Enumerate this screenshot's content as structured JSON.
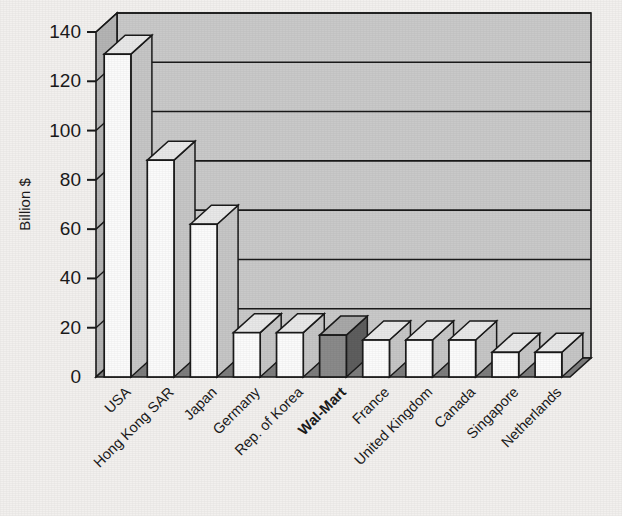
{
  "chart_data": {
    "type": "bar",
    "title": "",
    "subtitle": "",
    "xlabel": "",
    "ylabel": "Billion $",
    "ylim": [
      0,
      140
    ],
    "ytick_step": 20,
    "ytick_labels": [
      "0",
      "20",
      "40",
      "60",
      "80",
      "100",
      "120",
      "140"
    ],
    "grid": true,
    "legend": false,
    "style": "3d-column",
    "categories": [
      "USA",
      "Hong Kong SAR",
      "Japan",
      "Germany",
      "Rep. of Korea",
      "Wal-Mart",
      "France",
      "United Kingdom",
      "Canada",
      "Singapore",
      "Netherlands"
    ],
    "values": [
      131,
      88,
      62,
      18,
      18,
      17,
      15,
      15,
      15,
      10,
      10
    ],
    "highlight_index": 5,
    "highlight_label": "Wal-Mart",
    "annotations": []
  },
  "colors": {
    "background": "#f2f0ee",
    "wall": "#c9c9c9",
    "wall_side": "#b4b4b4",
    "floor": "#7d7d7d",
    "bar_face": "#fbfbfb",
    "bar_side": "#c6c6c6",
    "bar_top": "#e8e8e8",
    "bar_highlight_face": "#8a8a8a",
    "bar_highlight_side": "#5e5e5e",
    "bar_highlight_top": "#a8a8a8",
    "line": "#1a1a1a",
    "text": "#1a1a1a"
  }
}
